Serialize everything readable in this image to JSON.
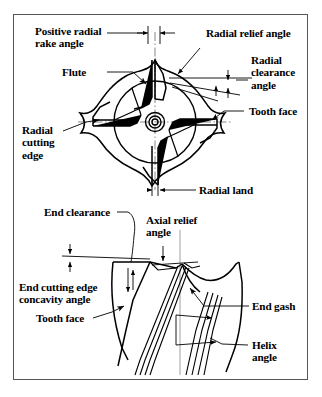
{
  "figure": {
    "border_color": "#555555",
    "background_color": "#ffffff",
    "ink_color": "#000000"
  },
  "views": {
    "top": {
      "name": "radial end view",
      "tooth_count": 4,
      "description": "Four-flute end mill cross section with central bore and centerlines"
    },
    "side": {
      "name": "axial side view",
      "description": "End mill side profile showing helical flutes and end cutting geometry"
    }
  },
  "labels": {
    "positive_radial_rake_angle": "Positive radial\nrake angle",
    "flute": "Flute",
    "radial_relief_angle": "Radial relief angle",
    "radial_clearance_angle": "Radial\nclearance\nangle",
    "tooth_face_top": "Tooth face",
    "radial_cutting_edge": "Radial\ncutting\nedge",
    "radial_land": "Radial land",
    "end_clearance": "End clearance",
    "axial_relief_angle": "Axial relief\nangle",
    "end_cutting_edge_concavity_angle": "End cutting edge\nconcavity angle",
    "tooth_face_side": "Tooth face",
    "end_gash": "End gash",
    "helix_angle": "Helix\nangle"
  }
}
